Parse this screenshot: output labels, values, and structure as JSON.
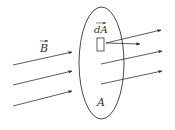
{
  "diagram": {
    "labels": {
      "field": "B",
      "area_element": "dA",
      "surface": "A"
    },
    "colors": {
      "stroke": "#333333",
      "background": "#ffffff"
    },
    "surface": {
      "cx": 101.5,
      "cy": 63,
      "rx": 22.5,
      "ry": 56
    },
    "area_element_rect": {
      "x": 97,
      "y": 38,
      "w": 7,
      "h": 13
    },
    "incoming_field_lines": [
      {
        "x1": 13,
        "y1": 65,
        "x2": 72,
        "y2": 52
      },
      {
        "x1": 13,
        "y1": 85,
        "x2": 72,
        "y2": 71
      },
      {
        "x1": 13,
        "y1": 106,
        "x2": 72,
        "y2": 91
      }
    ],
    "outgoing_field_lines": [
      {
        "x1": 106,
        "y1": 43,
        "x2": 161,
        "y2": 30
      },
      {
        "x1": 101,
        "y1": 64,
        "x2": 162,
        "y2": 51
      },
      {
        "x1": 101,
        "y1": 84,
        "x2": 162,
        "y2": 71
      }
    ],
    "normal_vector": {
      "x1": 106,
      "y1": 43,
      "x2": 140,
      "y2": 44
    }
  }
}
